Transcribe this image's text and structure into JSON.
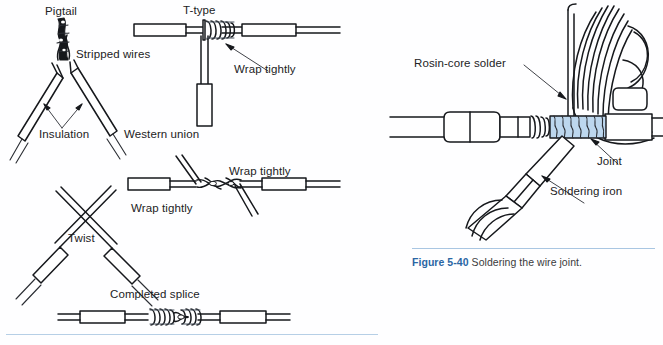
{
  "page": {
    "background_color": "#ffffff",
    "ink_color": "#16181c",
    "accent_blue": "#2a66a4",
    "rule_blue": "#a9c6e2",
    "solder_blue": "#bdd7ee"
  },
  "left_panel": {
    "name": "wire-splice-types-diagram",
    "labels": {
      "pigtail_title": "Pigtail",
      "ttype_title": "T-type",
      "stripped_wires": "Stripped wires",
      "insulation": "Insulation",
      "wrap_tightly_ttype": "Wrap tightly",
      "western_union": "Western union",
      "wrap_tightly_upper_right": "Wrap tightly",
      "wrap_tightly_lower_left": "Wrap tightly",
      "twist": "Twist",
      "completed_splice": "Completed splice"
    }
  },
  "right_panel": {
    "name": "soldering-the-wire-joint-diagram",
    "labels": {
      "rosin_core_solder": "Rosin-core solder",
      "joint": "Joint",
      "soldering_iron": "Soldering iron"
    },
    "caption": {
      "number": "Figure 5-40",
      "text": "Soldering the wire joint."
    }
  }
}
